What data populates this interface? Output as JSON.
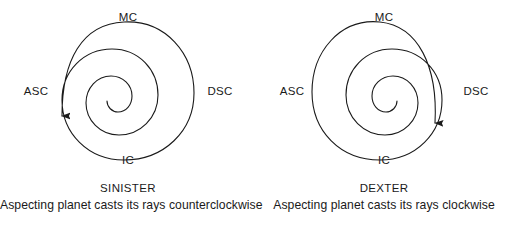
{
  "figure": {
    "background_color": "#ffffff",
    "stroke_color": "#1a1a1a",
    "text_color": "#1a1a1a",
    "panel_count": 2
  },
  "panels": [
    {
      "id": "sinister",
      "title": "SINISTER",
      "description": "Aspecting planet casts its rays counterclockwise",
      "direction": "counterclockwise",
      "arrow_position": "lower-left",
      "cardinals": {
        "top": "MC",
        "left": "ASC",
        "right": "DSC",
        "bottom": "IC"
      }
    },
    {
      "id": "dexter",
      "title": "DEXTER",
      "description": "Aspecting planet casts its rays clockwise",
      "direction": "clockwise",
      "arrow_position": "lower-right",
      "cardinals": {
        "top": "MC",
        "left": "ASC",
        "right": "DSC",
        "bottom": "IC"
      }
    }
  ]
}
